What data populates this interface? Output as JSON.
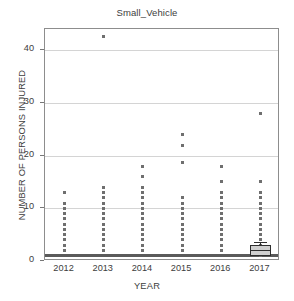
{
  "chart_data": {
    "type": "box",
    "title": "Small_Vehicle",
    "xlabel": "YEAR",
    "ylabel": "NUMBER OF PERSONS INJURED",
    "categories": [
      "2012",
      "2013",
      "2014",
      "2015",
      "2016",
      "2017"
    ],
    "ylim": [
      0,
      44
    ],
    "xlim_categories": 6,
    "yticks": [
      0,
      10,
      20,
      30,
      40
    ],
    "ytick_labels": [
      "0",
      "10",
      "20",
      "30",
      "40"
    ],
    "gridlines": [
      10,
      20,
      30,
      40
    ],
    "grid": true,
    "legend": null,
    "legend_position": "none",
    "marker_color": "#6f6f6f",
    "box_fill_color": "#cfcfcf",
    "box_edge_color": "#2e2e2e",
    "grid_color": "#d4d4d4",
    "frame_color": "#8d8d8d",
    "background_color": "#ffffff",
    "series": [
      {
        "name": "2012",
        "category": "2012",
        "baseline_value": 1,
        "baseline_count": 46,
        "stack_values": [
          1,
          2,
          3,
          4,
          5,
          6,
          7,
          8,
          9,
          10,
          11,
          13
        ],
        "outliers": [
          13
        ],
        "box": null,
        "median": 1,
        "q1": 1,
        "q3": 1,
        "whisker_low": 1,
        "whisker_high": 1
      },
      {
        "name": "2013",
        "category": "2013",
        "baseline_value": 1,
        "baseline_count": 52,
        "stack_values": [
          1,
          2,
          3,
          4,
          5,
          6,
          7,
          8,
          9,
          10,
          11,
          12,
          13,
          14
        ],
        "outliers": [
          42.5
        ],
        "box": null,
        "median": 1,
        "q1": 1,
        "q3": 1,
        "whisker_low": 1,
        "whisker_high": 1
      },
      {
        "name": "2014",
        "category": "2014",
        "baseline_value": 1,
        "baseline_count": 50,
        "stack_values": [
          1,
          2,
          3,
          4,
          5,
          6,
          7,
          8,
          9,
          10,
          11,
          12,
          13,
          14,
          16,
          18
        ],
        "outliers": [
          16,
          18
        ],
        "box": null,
        "median": 1,
        "q1": 1,
        "q3": 1,
        "whisker_low": 1,
        "whisker_high": 1
      },
      {
        "name": "2015",
        "category": "2015",
        "baseline_value": 1,
        "baseline_count": 54,
        "stack_values": [
          1,
          2,
          3,
          4,
          5,
          6,
          7,
          8,
          9,
          10,
          11,
          12,
          18.7,
          22,
          24
        ],
        "outliers": [
          18.7,
          22,
          24
        ],
        "box": null,
        "median": 1,
        "q1": 1,
        "q3": 1,
        "whisker_low": 1,
        "whisker_high": 1
      },
      {
        "name": "2016",
        "category": "2016",
        "baseline_value": 1,
        "baseline_count": 48,
        "stack_values": [
          1,
          2,
          3,
          4,
          5,
          6,
          7,
          8,
          9,
          10,
          11,
          12,
          13,
          15,
          18
        ],
        "outliers": [
          15,
          18
        ],
        "box": null,
        "median": 1,
        "q1": 1,
        "q3": 1,
        "whisker_low": 1,
        "whisker_high": 1
      },
      {
        "name": "2017",
        "category": "2017",
        "baseline_value": 1,
        "baseline_count": 30,
        "stack_values": [
          1,
          2,
          3,
          4,
          5,
          6,
          7,
          8,
          9,
          10,
          11,
          12,
          13,
          15,
          28
        ],
        "outliers": [
          15,
          28
        ],
        "box": {
          "q1": 1,
          "q3": 3
        },
        "median": 2,
        "q1": 1,
        "q3": 3,
        "whisker_low": 1,
        "whisker_high": 3.6
      }
    ]
  }
}
